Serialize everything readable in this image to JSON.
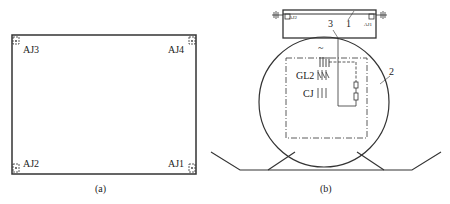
{
  "figure_a": {
    "caption": "(a)",
    "labels": {
      "top_left": "AJ3",
      "top_right": "AJ4",
      "bottom_left": "AJ2",
      "bottom_right": "AJ1"
    }
  },
  "figure_b": {
    "caption": "(b)",
    "top_box_labels": {
      "left": "AJ2",
      "right": "AJ1"
    },
    "callouts": {
      "one": "1",
      "two": "2",
      "three": "3"
    },
    "symbol_ac": "~",
    "labels": {
      "gl2": "GL2",
      "cj": "CJ"
    }
  }
}
